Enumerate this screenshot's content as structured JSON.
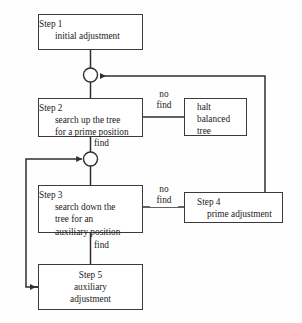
{
  "diagram": {
    "background_color": "#fefefe",
    "line_color": "#2f2f2f",
    "text_color": "#1b1b1b",
    "nodes": {
      "step1": {
        "heading": "Step 1",
        "body": "initial adjustment"
      },
      "step2": {
        "heading": "Step 2",
        "body_line1": "search up the tree",
        "body_line2": "for a prime position"
      },
      "halt": {
        "line1": "halt",
        "line2": "balanced",
        "line3": "tree"
      },
      "step3": {
        "heading": "Step 3",
        "body_line1": "search down the",
        "body_line2": "tree for an",
        "body_line3": "auxiliary position"
      },
      "step4": {
        "heading": "Step 4",
        "body": "prime adjustment"
      },
      "step5": {
        "heading": "Step 5",
        "body_line1": "auxiliary",
        "body_line2": "adjustment"
      }
    },
    "edge_labels": {
      "step2_no_find_line1": "no",
      "step2_no_find_line2": "find",
      "step2_find": "find",
      "step3_no_find_line1": "no",
      "step3_no_find_line2": "find",
      "step3_find": "find"
    },
    "junctions": {
      "top_merge": "merge-junction-1",
      "mid_merge": "merge-junction-2"
    }
  }
}
